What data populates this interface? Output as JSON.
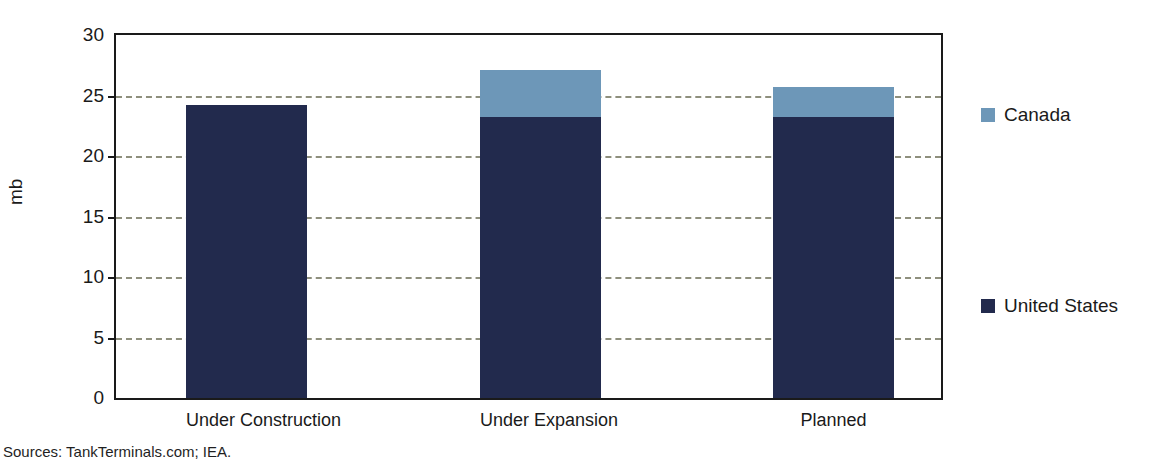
{
  "figure": {
    "title_clipped": "Crude Oil Storage Capacity Additions in North America",
    "source_note": "Sources: TankTerminals.com; IEA."
  },
  "colors": {
    "united_states": "#222a4d",
    "canada": "#6d97b8",
    "gridline": "#8e8f7d",
    "axis": "#1a1a1a",
    "background": "#ffffff"
  },
  "chart_data": {
    "type": "bar",
    "stacked": true,
    "title": "",
    "xlabel": "",
    "ylabel": "mb",
    "ylim": [
      0,
      30
    ],
    "yticks": [
      0,
      5,
      10,
      15,
      20,
      25,
      30
    ],
    "grid": true,
    "legend_position": "right",
    "categories": [
      "Under Construction",
      "Under Expansion",
      "Planned"
    ],
    "series": [
      {
        "name": "United States",
        "color": "#222a4d",
        "values": [
          24.2,
          23.2,
          23.2
        ]
      },
      {
        "name": "Canada",
        "color": "#6d97b8",
        "values": [
          0.0,
          3.9,
          2.5
        ]
      }
    ],
    "totals": [
      24.2,
      27.1,
      25.7
    ]
  },
  "axis": {
    "y_tick_labels": [
      "30",
      "25",
      "20",
      "15",
      "10",
      "5",
      "0"
    ],
    "y_axis_title": "mb"
  },
  "legend": {
    "items": [
      {
        "label": "Canada",
        "color": "#6d97b8"
      },
      {
        "label": "United States",
        "color": "#222a4d"
      }
    ]
  }
}
